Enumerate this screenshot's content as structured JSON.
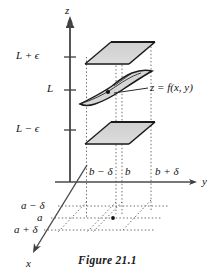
{
  "figure": {
    "caption": "Figure 21.1",
    "axes": {
      "z_label": "z",
      "y_label": "y",
      "x_label": "x"
    },
    "z_ticks": [
      {
        "label": "L + ϵ",
        "value": "L+epsilon"
      },
      {
        "label": "L",
        "value": "L"
      },
      {
        "label": "L − ϵ",
        "value": "L-epsilon"
      }
    ],
    "y_ticks": [
      {
        "label": "b − δ",
        "value": "b-delta"
      },
      {
        "label": "b",
        "value": "b"
      },
      {
        "label": "b + δ",
        "value": "b+delta"
      }
    ],
    "x_ticks": [
      {
        "label": "a − δ",
        "value": "a-delta"
      },
      {
        "label": "a",
        "value": "a"
      },
      {
        "label": "a + δ",
        "value": "a+delta"
      }
    ],
    "surface_label": "z = f(x, y)",
    "colors": {
      "plane_fill": "#d4d4d4",
      "plane_edge": "#1a1a1a",
      "axis": "#4a4a4a",
      "dotted": "#555555",
      "text": "#111111"
    },
    "elements": {
      "upper_plane_name": "upper bounding plane at L + ϵ",
      "lower_plane_name": "lower bounding plane at L − ϵ",
      "surface_name": "graph of z = f(x, y) near limit L",
      "limit_point_name": "point (a, b) with value near L",
      "base_point_name": "domain point (a, b)"
    }
  }
}
